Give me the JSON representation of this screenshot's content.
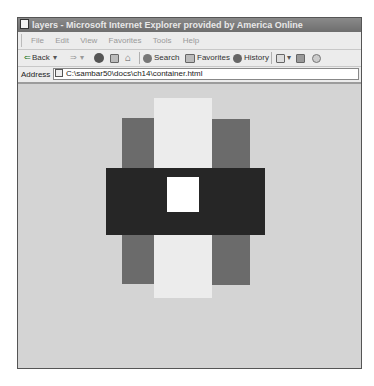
{
  "window": {
    "title": "layers - Microsoft Internet Explorer provided by America Online"
  },
  "menu": {
    "items": [
      "File",
      "Edit",
      "View",
      "Favorites",
      "Tools",
      "Help"
    ]
  },
  "toolbar": {
    "back_label": "Back",
    "back_dropdown": "▾",
    "forward_glyph": "⇒",
    "forward_dropdown": "▾",
    "search_label": "Search",
    "favorites_label": "Favorites",
    "history_label": "History"
  },
  "address": {
    "label": "Address",
    "url": "C:\\sambar50\\docs\\ch14\\container.html"
  },
  "page": {
    "background": "#d4d4d4",
    "layers": [
      {
        "name": "light-center-layer",
        "color": "#ececec",
        "x": 154,
        "y": 98,
        "w": 58,
        "h": 200
      },
      {
        "name": "left-gray-layer",
        "color": "#6b6b6b",
        "x": 122,
        "y": 118,
        "w": 32,
        "h": 166
      },
      {
        "name": "right-gray-layer",
        "color": "#6b6b6b",
        "x": 212,
        "y": 119,
        "w": 38,
        "h": 166
      },
      {
        "name": "black-bar-layer",
        "color": "#262626",
        "x": 106,
        "y": 168,
        "w": 159,
        "h": 67
      },
      {
        "name": "white-square-layer",
        "color": "#ffffff",
        "x": 167,
        "y": 177,
        "w": 32,
        "h": 35
      }
    ]
  }
}
